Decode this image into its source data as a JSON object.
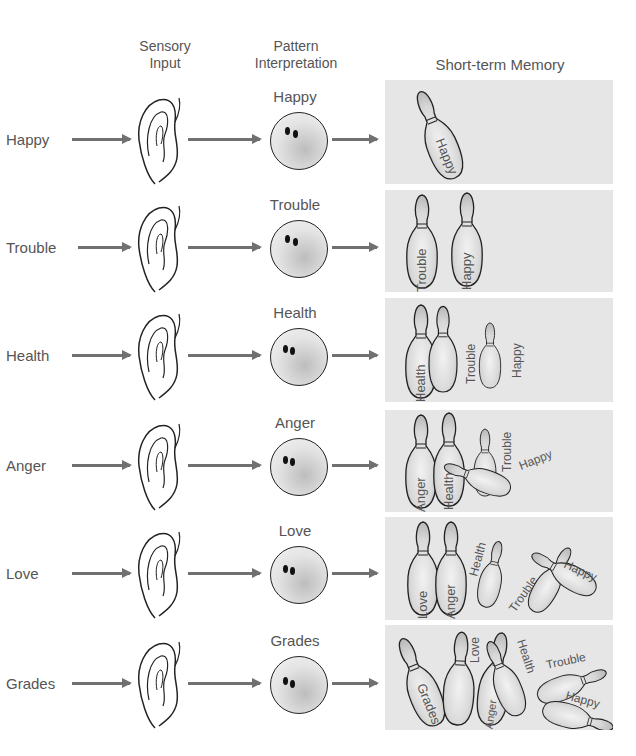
{
  "headers": {
    "sensory_input": "Sensory\nInput",
    "sensory_line1": "Sensory",
    "sensory_line2": "Input",
    "pattern_line1": "Pattern",
    "pattern_line2": "Interpretation",
    "memory": "Short-term Memory"
  },
  "colors": {
    "panel_bg": "#e6e6e6",
    "arrow": "#707070",
    "text": "#555555"
  },
  "rows": [
    {
      "input": "Happy",
      "interpretation": "Happy",
      "memory": [
        "Happy"
      ]
    },
    {
      "input": "Trouble",
      "interpretation": "Trouble",
      "memory": [
        "Trouble",
        "Happy"
      ]
    },
    {
      "input": "Health",
      "interpretation": "Health",
      "memory": [
        "Health",
        "Trouble",
        "Happy"
      ]
    },
    {
      "input": "Anger",
      "interpretation": "Anger",
      "memory": [
        "Anger",
        "Health",
        "Trouble",
        "Happy"
      ]
    },
    {
      "input": "Love",
      "interpretation": "Love",
      "memory": [
        "Love",
        "Anger",
        "Health",
        "Trouble",
        "Happy"
      ]
    },
    {
      "input": "Grades",
      "interpretation": "Grades",
      "memory": [
        "Grades",
        "Love",
        "Anger",
        "Health",
        "Trouble",
        "Happy"
      ]
    }
  ],
  "icons": {
    "sensory": "ear-icon",
    "interpretation": "bowling-ball-icon",
    "memory_item": "bowling-pin-icon"
  }
}
